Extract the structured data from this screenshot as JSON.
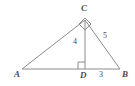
{
  "figure": {
    "type": "geometry-diagram",
    "stroke_color": "#8c8c8c",
    "text_color": "#4a4a4a",
    "background_color": "#ffffff",
    "vertices": [
      {
        "name": "A",
        "label": "A",
        "x": 22,
        "y": 69
      },
      {
        "name": "B",
        "label": "B",
        "x": 120,
        "y": 69
      },
      {
        "name": "C",
        "label": "C",
        "x": 85,
        "y": 20
      },
      {
        "name": "D",
        "label": "D",
        "x": 85,
        "y": 69
      }
    ],
    "segments": [
      {
        "name": "AB",
        "from": "A",
        "to": "B"
      },
      {
        "name": "AC",
        "from": "A",
        "to": "C"
      },
      {
        "name": "CB",
        "from": "C",
        "to": "B"
      },
      {
        "name": "CD",
        "from": "C",
        "to": "D"
      }
    ],
    "right_angles": [
      {
        "at": "C",
        "style": "rotated-square"
      },
      {
        "at": "D",
        "style": "square"
      }
    ],
    "measures": [
      {
        "name": "CD",
        "label": "4",
        "segment": "CD"
      },
      {
        "name": "DB",
        "label": "3",
        "segment": "DB"
      },
      {
        "name": "CB",
        "label": "5",
        "segment": "CB"
      }
    ]
  }
}
